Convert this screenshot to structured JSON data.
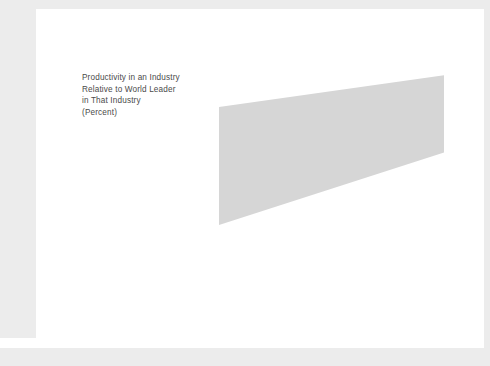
{
  "caption": {
    "lines": [
      "Productivity in an Industry",
      "Relative to World Leader",
      "in That Industry",
      "(Percent)"
    ]
  },
  "chart_data": {
    "type": "scatter",
    "title": "",
    "subtitle": "",
    "xlabel": "",
    "ylabel": "Productivity in an Industry Relative to World Leader in That Industry (Percent)",
    "xlim": [
      0,
      100
    ],
    "ylim": [
      0,
      100
    ],
    "grid": false,
    "legend": "none",
    "y_ticks": [
      0,
      20,
      40,
      60,
      80,
      100
    ],
    "y_tick_labels": [
      "0",
      "20",
      "40",
      "60",
      "80",
      "100"
    ],
    "x_ticks": [
      0,
      20,
      40,
      60,
      80,
      100
    ],
    "x_tick_labels": [
      "",
      "20",
      "40",
      "60",
      "80",
      "100"
    ],
    "points": [
      {
        "x": 4,
        "y": 71,
        "label": ""
      },
      {
        "x": 4,
        "y": 44,
        "label": ""
      },
      {
        "x": 13,
        "y": 43,
        "label": "German Beer (44%)"
      },
      {
        "x": 13,
        "y": 37,
        "label": "Japanese Food (33%)"
      },
      {
        "x": 20,
        "y": 86,
        "label": ""
      },
      {
        "x": 33,
        "y": 75,
        "label": ""
      },
      {
        "x": 38,
        "y": 81,
        "label": ""
      },
      {
        "x": 43,
        "y": 53,
        "label": ""
      },
      {
        "x": 44,
        "y": 48,
        "label": ""
      },
      {
        "x": 53,
        "y": 51,
        "label": ""
      },
      {
        "x": 58,
        "y": 72,
        "label": ""
      },
      {
        "x": 70,
        "y": 86,
        "label": "U.S. Autos (86%)"
      },
      {
        "x": 77,
        "y": 92,
        "label": ""
      },
      {
        "x": 83,
        "y": 93,
        "label": ""
      },
      {
        "x": 90,
        "y": 93,
        "label": ""
      },
      {
        "x": 92,
        "y": 89,
        "label": "German Computers (89%)"
      },
      {
        "x": 99,
        "y": 93,
        "label": ""
      },
      {
        "x": 99,
        "y": 88,
        "label": ""
      }
    ],
    "trend_line": {
      "x0": 0,
      "y0": 54,
      "x1": 100,
      "y1": 87
    },
    "band": {
      "upper": [
        {
          "x": 0,
          "y": 85
        },
        {
          "x": 100,
          "y": 99
        }
      ],
      "lower": [
        {
          "x": 0,
          "y": 33
        },
        {
          "x": 100,
          "y": 65
        }
      ],
      "color": "#d6d6d6"
    },
    "annotations": [
      {
        "name": "german-computers",
        "text": "German Computers (89%)",
        "value": 89
      },
      {
        "name": "us-autos",
        "text": "U.S. Autos (86%)",
        "value": 86
      },
      {
        "name": "german-beer",
        "text": "German Beer (44%)",
        "value": 44
      },
      {
        "name": "japanese-food",
        "text": "Japanese Food (33%)",
        "value": 33
      }
    ],
    "x_axis_categories": [
      {
        "line1": "Local",
        "line2": "Competition"
      },
      {
        "line1": "Regional",
        "line2": "Competition"
      },
      {
        "line1": "Global",
        "line2": "Competition"
      }
    ]
  },
  "colors": {
    "band": "#d6d6d6",
    "point": "#1a1a1a",
    "line": "#111111",
    "axis": "#555555",
    "page_edge": "#ececec"
  }
}
